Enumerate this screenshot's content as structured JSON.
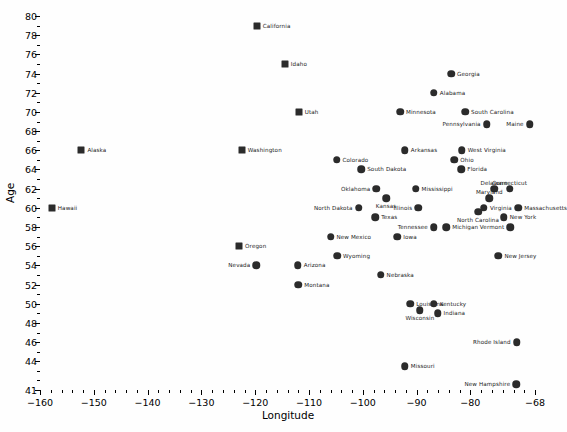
{
  "chart_data": {
    "type": "scatter",
    "title": "",
    "xlabel": "Longitude",
    "ylabel": "Age",
    "xlim": [
      -160,
      -68
    ],
    "ylim": [
      41,
      80
    ],
    "xticks": [
      -160,
      -150,
      -140,
      -130,
      -120,
      -110,
      -100,
      -90,
      -80,
      -68
    ],
    "yticks": [
      41,
      44,
      46,
      48,
      50,
      52,
      54,
      56,
      58,
      60,
      62,
      64,
      66,
      68,
      70,
      72,
      74,
      76,
      78,
      80
    ],
    "grid": false,
    "legend": "none",
    "marker_color": "#2b2b2b",
    "points": [
      {
        "label": "California",
        "x": -119.7,
        "y": 79,
        "marker": "square",
        "lpos": "right"
      },
      {
        "label": "Idaho",
        "x": -114.5,
        "y": 75,
        "marker": "square",
        "lpos": "right"
      },
      {
        "label": "Georgia",
        "x": -83.6,
        "y": 74,
        "marker": "circle",
        "lpos": "right"
      },
      {
        "label": "Alabama",
        "x": -86.8,
        "y": 72,
        "marker": "circle",
        "lpos": "right"
      },
      {
        "label": "Utah",
        "x": -111.9,
        "y": 70,
        "marker": "square",
        "lpos": "right"
      },
      {
        "label": "Minnesota",
        "x": -93.1,
        "y": 70,
        "marker": "circle",
        "lpos": "right"
      },
      {
        "label": "South Carolina",
        "x": -81.0,
        "y": 70,
        "marker": "circle",
        "lpos": "right"
      },
      {
        "label": "Pennsylvania",
        "x": -77.0,
        "y": 68.7,
        "marker": "circle",
        "lpos": "left"
      },
      {
        "label": "Maine",
        "x": -69.0,
        "y": 68.7,
        "marker": "circle",
        "lpos": "left"
      },
      {
        "label": "Alaska",
        "x": -152.3,
        "y": 66,
        "marker": "square",
        "lpos": "right"
      },
      {
        "label": "Washington",
        "x": -122.5,
        "y": 66,
        "marker": "square",
        "lpos": "right"
      },
      {
        "label": "Arkansas",
        "x": -92.2,
        "y": 66,
        "marker": "circle",
        "lpos": "right"
      },
      {
        "label": "West Virginia",
        "x": -81.6,
        "y": 66,
        "marker": "circle",
        "lpos": "right"
      },
      {
        "label": "Colorado",
        "x": -104.9,
        "y": 65,
        "marker": "circle",
        "lpos": "right"
      },
      {
        "label": "Ohio",
        "x": -83.0,
        "y": 65,
        "marker": "circle",
        "lpos": "right"
      },
      {
        "label": "South Dakota",
        "x": -100.3,
        "y": 64,
        "marker": "circle",
        "lpos": "right"
      },
      {
        "label": "Florida",
        "x": -81.7,
        "y": 64,
        "marker": "circle",
        "lpos": "right"
      },
      {
        "label": "Oklahoma",
        "x": -97.5,
        "y": 62,
        "marker": "circle",
        "lpos": "left"
      },
      {
        "label": "Mississippi",
        "x": -90.2,
        "y": 62,
        "marker": "circle",
        "lpos": "right"
      },
      {
        "label": "Delaware",
        "x": -75.6,
        "y": 62,
        "marker": "circle",
        "lpos": "above"
      },
      {
        "label": "Connecticut",
        "x": -72.7,
        "y": 62,
        "marker": "circle",
        "lpos": "above"
      },
      {
        "label": "Kansas",
        "x": -95.7,
        "y": 61,
        "marker": "circle",
        "lpos": "below"
      },
      {
        "label": "Maryland",
        "x": -76.5,
        "y": 61,
        "marker": "above-left",
        "lpos": "above"
      },
      {
        "label": "North Dakota",
        "x": -100.8,
        "y": 60,
        "marker": "circle",
        "lpos": "left"
      },
      {
        "label": "Illinois",
        "x": -89.7,
        "y": 60,
        "marker": "circle",
        "lpos": "left"
      },
      {
        "label": "Virginia",
        "x": -77.5,
        "y": 60,
        "marker": "circle",
        "lpos": "right"
      },
      {
        "label": "Massachusetts",
        "x": -71.1,
        "y": 60,
        "marker": "circle",
        "lpos": "right"
      },
      {
        "label": "Hawaii",
        "x": -157.8,
        "y": 60,
        "marker": "square",
        "lpos": "right"
      },
      {
        "label": "Texas",
        "x": -97.7,
        "y": 59,
        "marker": "circle",
        "lpos": "right"
      },
      {
        "label": "North Carolina",
        "x": -78.6,
        "y": 59.6,
        "marker": "circle",
        "lpos": "below"
      },
      {
        "label": "New York",
        "x": -73.8,
        "y": 59,
        "marker": "circle",
        "lpos": "right"
      },
      {
        "label": "Tennessee",
        "x": -86.8,
        "y": 58,
        "marker": "circle",
        "lpos": "left"
      },
      {
        "label": "Michigan",
        "x": -84.5,
        "y": 58,
        "marker": "circle",
        "lpos": "right"
      },
      {
        "label": "Vermont",
        "x": -72.6,
        "y": 58,
        "marker": "circle",
        "lpos": "left"
      },
      {
        "label": "New Mexico",
        "x": -106.0,
        "y": 57,
        "marker": "circle",
        "lpos": "right"
      },
      {
        "label": "Iowa",
        "x": -93.6,
        "y": 57,
        "marker": "circle",
        "lpos": "right"
      },
      {
        "label": "Oregon",
        "x": -123.0,
        "y": 56,
        "marker": "square",
        "lpos": "right"
      },
      {
        "label": "Wyoming",
        "x": -104.8,
        "y": 55,
        "marker": "circle",
        "lpos": "right"
      },
      {
        "label": "New Jersey",
        "x": -74.8,
        "y": 55,
        "marker": "circle",
        "lpos": "right"
      },
      {
        "label": "Nevada",
        "x": -119.8,
        "y": 54,
        "marker": "circle",
        "lpos": "left"
      },
      {
        "label": "Arizona",
        "x": -112.1,
        "y": 54,
        "marker": "circle",
        "lpos": "right"
      },
      {
        "label": "Nebraska",
        "x": -96.7,
        "y": 53,
        "marker": "circle",
        "lpos": "right"
      },
      {
        "label": "Montana",
        "x": -112.0,
        "y": 52,
        "marker": "circle",
        "lpos": "right"
      },
      {
        "label": "Louisiana",
        "x": -91.2,
        "y": 50,
        "marker": "circle",
        "lpos": "right"
      },
      {
        "label": "Kentucky",
        "x": -86.8,
        "y": 50,
        "marker": "circle",
        "lpos": "right"
      },
      {
        "label": "Wisconsin",
        "x": -89.4,
        "y": 49.3,
        "marker": "circle",
        "lpos": "below"
      },
      {
        "label": "Indiana",
        "x": -86.1,
        "y": 49,
        "marker": "circle",
        "lpos": "right"
      },
      {
        "label": "Rhode Island",
        "x": -71.4,
        "y": 46,
        "marker": "circle",
        "lpos": "left"
      },
      {
        "label": "Missouri",
        "x": -92.2,
        "y": 43.5,
        "marker": "circle",
        "lpos": "right"
      },
      {
        "label": "New Hampshire",
        "x": -71.5,
        "y": 41.6,
        "marker": "circle",
        "lpos": "left"
      }
    ]
  }
}
